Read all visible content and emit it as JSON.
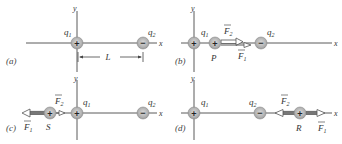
{
  "panels": [
    {
      "id": "a",
      "label": "(a)",
      "axis_x_label": "x",
      "axis_y_label": "y",
      "charges": [
        {
          "name": "q1",
          "symbol": "q",
          "subscript": "1",
          "sign": "+"
        },
        {
          "name": "q2",
          "symbol": "q",
          "subscript": "2",
          "sign": "−"
        }
      ],
      "dimension_label": "L"
    },
    {
      "id": "b",
      "label": "(b)",
      "axis_x_label": "x",
      "axis_y_label": "y",
      "charges": [
        {
          "name": "q1",
          "symbol": "q",
          "subscript": "1",
          "sign": "+"
        },
        {
          "name": "P",
          "symbol": "P",
          "sign": "+"
        },
        {
          "name": "q2",
          "symbol": "q",
          "subscript": "2",
          "sign": "−"
        }
      ],
      "forces": [
        {
          "name": "F2",
          "symbol": "F",
          "subscript": "2",
          "direction": "right"
        },
        {
          "name": "F1",
          "symbol": "F",
          "subscript": "1",
          "direction": "right"
        }
      ]
    },
    {
      "id": "c",
      "label": "(c)",
      "axis_x_label": "x",
      "axis_y_label": "y",
      "charges": [
        {
          "name": "S",
          "symbol": "S",
          "sign": "+"
        },
        {
          "name": "q1",
          "symbol": "q",
          "subscript": "1",
          "sign": "+"
        },
        {
          "name": "q2",
          "symbol": "q",
          "subscript": "2",
          "sign": "−"
        }
      ],
      "forces": [
        {
          "name": "F2",
          "symbol": "F",
          "subscript": "2",
          "direction": "right"
        },
        {
          "name": "F1",
          "symbol": "F",
          "subscript": "1",
          "direction": "left"
        }
      ]
    },
    {
      "id": "d",
      "label": "(d)",
      "axis_x_label": "x",
      "axis_y_label": "y",
      "charges": [
        {
          "name": "q1",
          "symbol": "q",
          "subscript": "1",
          "sign": "+"
        },
        {
          "name": "q2",
          "symbol": "q",
          "subscript": "2",
          "sign": "−"
        },
        {
          "name": "R",
          "symbol": "R",
          "sign": "+"
        }
      ],
      "forces": [
        {
          "name": "F2",
          "symbol": "F",
          "subscript": "2",
          "direction": "left"
        },
        {
          "name": "F1",
          "symbol": "F",
          "subscript": "1",
          "direction": "right"
        }
      ]
    }
  ],
  "colors": {
    "charge_fill": "#b8b8b8",
    "charge_edge": "#8a8a8a",
    "axis": "#5a5a5a",
    "arrow_fill": "#ffffff",
    "arrow_stroke": "#555555"
  }
}
